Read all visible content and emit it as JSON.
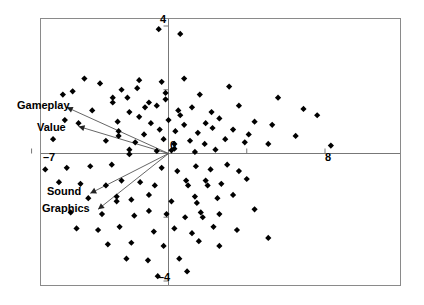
{
  "figure": {
    "type": "biplot-scatter",
    "background_color": "#ffffff",
    "frame_color": "#888888",
    "axis_color": "#777777",
    "marker_color": "#000000",
    "vector_color": "#555555"
  },
  "axes": {
    "x_label_min": "–7",
    "x_label_max": "8",
    "y_label_max": "4",
    "y_label_min": "–4",
    "origin_label": "0"
  },
  "vectors": {
    "gameplay_label": "Gameplay",
    "value_label": "Value",
    "sound_label": "Sound",
    "graphics_label": "Graphics"
  },
  "chart_data": {
    "type": "scatter",
    "title": "",
    "xlabel": "",
    "ylabel": "",
    "xlim": [
      -7,
      9.5
    ],
    "ylim": [
      -4.3,
      4.2
    ],
    "grid": false,
    "legend": false,
    "xticks": [
      -7,
      0,
      4,
      8
    ],
    "xtick_labels": [
      "–7",
      "0",
      "",
      "8"
    ],
    "yticks": [
      -4,
      -2,
      0,
      2,
      4
    ],
    "ytick_labels": [
      "–4",
      "",
      "0",
      "",
      "4"
    ],
    "marker": "diamond",
    "marker_color": "#000000",
    "marker_size": 5,
    "points": [
      [
        -0.5,
        3.9
      ],
      [
        0.6,
        3.75
      ],
      [
        -4.3,
        2.35
      ],
      [
        -3.5,
        2.2
      ],
      [
        -1.5,
        2.3
      ],
      [
        -1.6,
        2.05
      ],
      [
        -2.4,
        2.0
      ],
      [
        -0.35,
        2.25
      ],
      [
        0.8,
        2.35
      ],
      [
        -4.9,
        1.95
      ],
      [
        -5.4,
        1.85
      ],
      [
        -2.85,
        1.75
      ],
      [
        -2.85,
        1.6
      ],
      [
        -2.1,
        1.75
      ],
      [
        -1.0,
        1.6
      ],
      [
        -0.15,
        1.9
      ],
      [
        -0.15,
        1.7
      ],
      [
        1.6,
        1.85
      ],
      [
        3.1,
        2.1
      ],
      [
        -3.9,
        1.35
      ],
      [
        -2.0,
        1.3
      ],
      [
        -1.2,
        1.45
      ],
      [
        -0.6,
        1.5
      ],
      [
        0.5,
        1.35
      ],
      [
        0.6,
        1.2
      ],
      [
        1.2,
        1.45
      ],
      [
        2.2,
        1.3
      ],
      [
        3.6,
        1.5
      ],
      [
        5.6,
        1.75
      ],
      [
        6.9,
        1.4
      ],
      [
        -5.3,
        1.05
      ],
      [
        -4.6,
        0.95
      ],
      [
        -2.6,
        1.0
      ],
      [
        -1.5,
        1.15
      ],
      [
        -0.9,
        0.95
      ],
      [
        0.0,
        1.05
      ],
      [
        0.8,
        0.9
      ],
      [
        1.9,
        0.95
      ],
      [
        2.6,
        1.1
      ],
      [
        4.4,
        1.0
      ],
      [
        7.6,
        1.2
      ],
      [
        -2.55,
        0.7
      ],
      [
        -2.55,
        0.55
      ],
      [
        -1.25,
        0.6
      ],
      [
        -0.45,
        0.75
      ],
      [
        0.35,
        0.7
      ],
      [
        1.5,
        0.65
      ],
      [
        2.25,
        0.8
      ],
      [
        3.3,
        0.75
      ],
      [
        4.1,
        0.6
      ],
      [
        5.3,
        0.9
      ],
      [
        6.5,
        0.55
      ],
      [
        -5.9,
        0.45
      ],
      [
        -3.2,
        0.4
      ],
      [
        -1.7,
        0.35
      ],
      [
        -0.25,
        0.45
      ],
      [
        0.3,
        0.3
      ],
      [
        0.3,
        0.15
      ],
      [
        1.1,
        0.4
      ],
      [
        1.85,
        0.3
      ],
      [
        2.9,
        0.45
      ],
      [
        3.9,
        0.35
      ],
      [
        5.1,
        0.3
      ],
      [
        -2.0,
        0.12
      ],
      [
        -2.0,
        -0.02
      ],
      [
        -0.6,
        0.08
      ],
      [
        0.15,
        0.1
      ],
      [
        1.35,
        0.05
      ],
      [
        2.4,
        0.12
      ],
      [
        8.3,
        0.25
      ],
      [
        -6.3,
        -0.5
      ],
      [
        -5.2,
        -0.45
      ],
      [
        -4.0,
        -0.4
      ],
      [
        -2.9,
        -0.35
      ],
      [
        -0.35,
        -0.45
      ],
      [
        0.45,
        -0.55
      ],
      [
        1.4,
        -0.4
      ],
      [
        2.15,
        -0.5
      ],
      [
        3.0,
        -0.35
      ],
      [
        3.6,
        -0.55
      ],
      [
        -5.6,
        -0.9
      ],
      [
        -4.5,
        -0.95
      ],
      [
        -3.2,
        -1.0
      ],
      [
        -2.4,
        -0.85
      ],
      [
        -1.45,
        -0.9
      ],
      [
        -0.7,
        -1.0
      ],
      [
        0.9,
        -0.85
      ],
      [
        1.0,
        -1.0
      ],
      [
        1.9,
        -0.85
      ],
      [
        2.0,
        -1.0
      ],
      [
        2.7,
        -0.95
      ],
      [
        4.0,
        -0.8
      ],
      [
        -4.1,
        -1.4
      ],
      [
        -2.65,
        -1.35
      ],
      [
        -2.65,
        -1.5
      ],
      [
        -1.9,
        -1.45
      ],
      [
        -1.0,
        -1.3
      ],
      [
        0.15,
        -1.5
      ],
      [
        1.35,
        -1.35
      ],
      [
        1.45,
        -1.55
      ],
      [
        2.5,
        -1.4
      ],
      [
        3.3,
        -1.3
      ],
      [
        -5.0,
        -1.85
      ],
      [
        -3.4,
        -1.9
      ],
      [
        -1.75,
        -1.95
      ],
      [
        -1.0,
        -1.8
      ],
      [
        -0.1,
        -1.9
      ],
      [
        0.85,
        -2.0
      ],
      [
        1.65,
        -1.85
      ],
      [
        1.75,
        -2.0
      ],
      [
        2.6,
        -1.9
      ],
      [
        4.4,
        -1.75
      ],
      [
        -4.7,
        -2.35
      ],
      [
        -3.6,
        -2.4
      ],
      [
        -2.5,
        -2.3
      ],
      [
        -0.75,
        -2.45
      ],
      [
        0.3,
        -2.35
      ],
      [
        1.2,
        -2.5
      ],
      [
        2.3,
        -2.3
      ],
      [
        3.5,
        -2.4
      ],
      [
        -3.1,
        -2.85
      ],
      [
        -1.9,
        -2.8
      ],
      [
        -0.25,
        -2.9
      ],
      [
        1.55,
        -2.75
      ],
      [
        2.6,
        -2.9
      ],
      [
        5.1,
        -2.65
      ],
      [
        -2.15,
        -3.3
      ],
      [
        -1.05,
        -3.35
      ],
      [
        0.55,
        -3.3
      ],
      [
        -0.55,
        -3.85
      ],
      [
        0.95,
        -3.7
      ]
    ],
    "vectors": [
      {
        "label": "Gameplay",
        "x": -5.2,
        "y": 1.45
      },
      {
        "label": "Value",
        "x": -4.6,
        "y": 0.85
      },
      {
        "label": "Sound",
        "x": -4.0,
        "y": -1.25
      },
      {
        "label": "Graphics",
        "x": -3.6,
        "y": -1.75
      }
    ]
  }
}
